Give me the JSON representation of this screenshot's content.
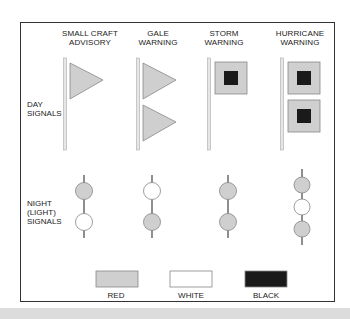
{
  "colors": {
    "red": "#cfcfcf",
    "white": "#ffffff",
    "black": "#1a1a1a",
    "pole": "#e6e6e6",
    "stroke": "#888888"
  },
  "columns": [
    {
      "title_line1": "SMALL CRAFT",
      "title_line2": "ADVISORY",
      "day": {
        "shape": "pennant",
        "count": 1
      },
      "night": [
        "red",
        "white"
      ]
    },
    {
      "title_line1": "GALE",
      "title_line2": "WARNING",
      "day": {
        "shape": "pennant",
        "count": 2
      },
      "night": [
        "white",
        "red"
      ]
    },
    {
      "title_line1": "STORM",
      "title_line2": "WARNING",
      "day": {
        "shape": "square-flag",
        "count": 1
      },
      "night": [
        "red",
        "red"
      ]
    },
    {
      "title_line1": "HURRICANE",
      "title_line2": "WARNING",
      "day": {
        "shape": "square-flag",
        "count": 2
      },
      "night": [
        "red",
        "white",
        "red"
      ]
    }
  ],
  "rows": {
    "day_line1": "DAY",
    "day_line2": "SIGNALS",
    "night_line1": "NIGHT",
    "night_line2": "(LIGHT)",
    "night_line3": "SIGNALS"
  },
  "legend": [
    {
      "label": "RED",
      "color": "red"
    },
    {
      "label": "WHITE",
      "color": "white"
    },
    {
      "label": "BLACK",
      "color": "black"
    }
  ]
}
